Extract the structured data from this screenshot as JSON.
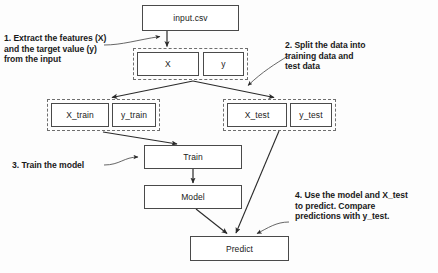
{
  "diagram": {
    "nodes": [
      {
        "id": "input",
        "label": "input.csv",
        "x": 142,
        "y": 5,
        "w": 97,
        "h": 26
      },
      {
        "id": "X",
        "label": "X",
        "x": 137,
        "y": 52,
        "w": 62,
        "h": 24
      },
      {
        "id": "y",
        "label": "y",
        "x": 203,
        "y": 52,
        "w": 41,
        "h": 24
      },
      {
        "id": "X_train",
        "label": "X_train",
        "x": 51,
        "y": 103,
        "w": 58,
        "h": 24
      },
      {
        "id": "y_train",
        "label": "y_train",
        "x": 112,
        "y": 103,
        "w": 44,
        "h": 24
      },
      {
        "id": "X_test",
        "label": "X_test",
        "x": 227,
        "y": 103,
        "w": 60,
        "h": 24
      },
      {
        "id": "y_test",
        "label": "y_test",
        "x": 290,
        "y": 103,
        "w": 42,
        "h": 24
      },
      {
        "id": "train",
        "label": "Train",
        "x": 144,
        "y": 145,
        "w": 98,
        "h": 24
      },
      {
        "id": "model",
        "label": "Model",
        "x": 144,
        "y": 185,
        "w": 98,
        "h": 24
      },
      {
        "id": "predict",
        "label": "Predict",
        "x": 190,
        "y": 236,
        "w": 99,
        "h": 25
      }
    ],
    "groups": [
      {
        "id": "xy-group",
        "x": 133,
        "y": 48,
        "w": 115,
        "h": 32
      },
      {
        "id": "train-group",
        "x": 47,
        "y": 99,
        "w": 113,
        "h": 32
      },
      {
        "id": "test-group",
        "x": 223,
        "y": 99,
        "w": 113,
        "h": 32
      }
    ],
    "annotations": [
      {
        "id": "step-1",
        "text": "1. Extract the features (X)\n    and the target value (y)\n    from the input",
        "x": 4,
        "y": 33
      },
      {
        "id": "step-2",
        "text": "2. Split the data into\n    training data and\n    test data",
        "x": 285,
        "y": 40
      },
      {
        "id": "step-3",
        "text": "3. Train the model",
        "x": 12,
        "y": 160
      },
      {
        "id": "step-4",
        "text": "4. Use the model and X_test\n    to predict. Compare\n    predictions with y_test.",
        "x": 295,
        "y": 190
      }
    ],
    "colors": {
      "box_border": "#4a4a4a",
      "dash_border": "#6e6e6e",
      "arrow": "#2a2a2a",
      "text": "#1a1a1a",
      "background": "#fdfdfd"
    }
  }
}
